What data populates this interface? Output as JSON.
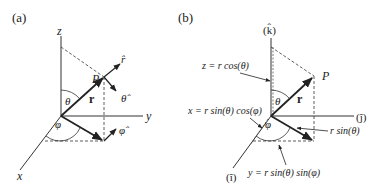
{
  "panel_a": {
    "label": "(a)",
    "axes": {
      "z": "z",
      "y": "y",
      "x": "x"
    },
    "point": "P",
    "vector": "r",
    "angle_theta": "θ",
    "angle_phi": "φ",
    "unit_r": "r̂",
    "unit_theta": "θ̂",
    "unit_phi": "φ̂"
  },
  "panel_b": {
    "label": "(b)",
    "axes": {
      "k": "(k̂)",
      "j": "(ĵ)",
      "i": "(î)"
    },
    "point": "P",
    "vector": "r",
    "angle_theta": "θ",
    "angle_phi": "φ",
    "eq_z": "z = r cos(θ)",
    "eq_x": "x = r sin(θ) cos(φ)",
    "eq_proj": "r sin(θ)",
    "eq_y": "y = r sin(θ) sin(φ)"
  }
}
